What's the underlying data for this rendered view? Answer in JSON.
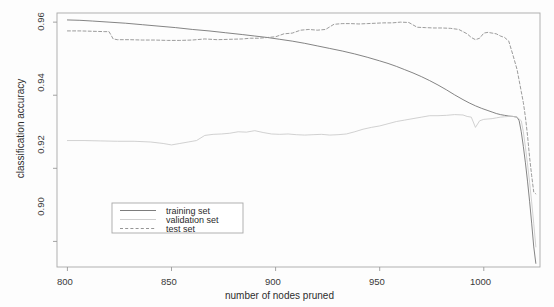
{
  "chart_data": {
    "type": "line",
    "title": "",
    "xlabel": "number of nodes pruned",
    "ylabel": "classification accuracy",
    "xlim": [
      795,
      1027
    ],
    "ylim": [
      0.893,
      0.9625
    ],
    "grid": false,
    "legend_position": "bottom-left",
    "xticks": [
      800,
      850,
      900,
      950,
      1000
    ],
    "xtick_labels": [
      "800",
      "850",
      "900",
      "950",
      "1000"
    ],
    "yticks": [
      0.9,
      0.92,
      0.94,
      0.96
    ],
    "ytick_labels": [
      "0.90",
      "0.92",
      "0.94",
      "0.96"
    ],
    "series": [
      {
        "name": "training set",
        "style": "solid",
        "color": "#6e6e6e",
        "x": [
          800,
          806,
          812,
          820,
          828,
          836,
          844,
          852,
          860,
          868,
          876,
          884,
          890,
          896,
          902,
          908,
          914,
          920,
          926,
          932,
          938,
          944,
          950,
          954,
          958,
          962,
          966,
          970,
          974,
          978,
          982,
          986,
          990,
          993,
          996,
          999,
          1002,
          1004,
          1006,
          1008,
          1010,
          1012,
          1014,
          1016,
          1017,
          1018,
          1019,
          1020,
          1021,
          1022,
          1023,
          1024,
          1025
        ],
        "values": [
          0.9606,
          0.9605,
          0.9603,
          0.96,
          0.9597,
          0.9593,
          0.9589,
          0.9585,
          0.958,
          0.9576,
          0.9571,
          0.9566,
          0.9562,
          0.9558,
          0.9553,
          0.9548,
          0.9542,
          0.9535,
          0.9528,
          0.9521,
          0.9513,
          0.9504,
          0.9494,
          0.9487,
          0.9479,
          0.947,
          0.9461,
          0.9451,
          0.944,
          0.9428,
          0.9415,
          0.9401,
          0.9388,
          0.9379,
          0.9371,
          0.9364,
          0.9358,
          0.9354,
          0.935,
          0.9347,
          0.9345,
          0.9343,
          0.9342,
          0.934,
          0.933,
          0.93,
          0.926,
          0.9215,
          0.9165,
          0.911,
          0.905,
          0.8985,
          0.894
        ]
      },
      {
        "name": "validation set",
        "style": "solid",
        "color": "#c9c9c9",
        "x": [
          800,
          808,
          816,
          824,
          832,
          840,
          846,
          850,
          854,
          858,
          862,
          866,
          870,
          874,
          878,
          882,
          886,
          890,
          894,
          898,
          902,
          906,
          910,
          914,
          918,
          922,
          926,
          930,
          934,
          938,
          942,
          946,
          950,
          954,
          958,
          962,
          966,
          970,
          974,
          978,
          982,
          986,
          990,
          992,
          994,
          996,
          998,
          1000,
          1002,
          1004,
          1006,
          1008,
          1010,
          1012,
          1014,
          1016,
          1018,
          1019,
          1020,
          1021,
          1022,
          1023,
          1024,
          1025
        ],
        "values": [
          0.9276,
          0.9276,
          0.9275,
          0.9274,
          0.9274,
          0.9272,
          0.9268,
          0.9264,
          0.9268,
          0.9272,
          0.9276,
          0.929,
          0.9293,
          0.9294,
          0.9296,
          0.93,
          0.9299,
          0.9303,
          0.9298,
          0.9294,
          0.9293,
          0.9294,
          0.9292,
          0.9291,
          0.9292,
          0.9293,
          0.9291,
          0.9292,
          0.9294,
          0.93,
          0.9307,
          0.9312,
          0.9316,
          0.9322,
          0.9328,
          0.9332,
          0.9336,
          0.934,
          0.9344,
          0.9344,
          0.9345,
          0.9347,
          0.9346,
          0.9342,
          0.934,
          0.9312,
          0.933,
          0.9334,
          0.9335,
          0.9336,
          0.9338,
          0.934,
          0.9341,
          0.9342,
          0.9342,
          0.934,
          0.933,
          0.93,
          0.9258,
          0.9212,
          0.9162,
          0.9108,
          0.9048,
          0.8985
        ]
      },
      {
        "name": "test set",
        "style": "dashed",
        "color": "#8a8a8a",
        "x": [
          800,
          806,
          812,
          818,
          820,
          822,
          824,
          830,
          836,
          842,
          848,
          854,
          860,
          866,
          872,
          878,
          884,
          888,
          892,
          896,
          900,
          904,
          908,
          912,
          916,
          920,
          924,
          928,
          932,
          936,
          940,
          944,
          948,
          952,
          956,
          960,
          964,
          968,
          972,
          976,
          980,
          984,
          988,
          990,
          992,
          994,
          996,
          998,
          1000,
          1002,
          1004,
          1006,
          1008,
          1010,
          1012,
          1014,
          1016,
          1018,
          1019,
          1020,
          1021,
          1022,
          1023,
          1024,
          1025
        ],
        "values": [
          0.9576,
          0.9576,
          0.9575,
          0.9574,
          0.9574,
          0.9554,
          0.9552,
          0.9552,
          0.9551,
          0.9551,
          0.955,
          0.955,
          0.9551,
          0.9554,
          0.9552,
          0.9553,
          0.9554,
          0.9556,
          0.9556,
          0.9558,
          0.956,
          0.9568,
          0.957,
          0.9578,
          0.958,
          0.9578,
          0.958,
          0.9594,
          0.9596,
          0.9596,
          0.9595,
          0.9596,
          0.9597,
          0.9598,
          0.9598,
          0.96,
          0.9599,
          0.9586,
          0.9585,
          0.9584,
          0.9584,
          0.9583,
          0.958,
          0.9574,
          0.9568,
          0.9558,
          0.9552,
          0.9556,
          0.957,
          0.9572,
          0.957,
          0.9568,
          0.9562,
          0.9558,
          0.9548,
          0.951,
          0.947,
          0.941,
          0.938,
          0.934,
          0.929,
          0.923,
          0.918,
          0.9135,
          0.913
        ]
      }
    ]
  },
  "legend": {
    "entries": [
      {
        "label": "training set"
      },
      {
        "label": "validation set"
      },
      {
        "label": "test set"
      }
    ]
  },
  "colors": {
    "axis": "#9a9a9a",
    "frame": "#a8a8a8",
    "text": "#2e2e2e",
    "background": "#fdfdfd"
  }
}
